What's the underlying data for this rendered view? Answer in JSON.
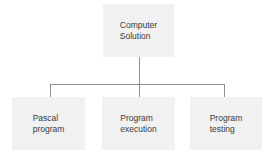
{
  "diagram": {
    "type": "hierarchy",
    "root": {
      "label": "Computer\nSolution"
    },
    "children": [
      {
        "label": "Pascal\nprogram"
      },
      {
        "label": "Program\nexecution"
      },
      {
        "label": "Program\ntesting"
      }
    ],
    "colors": {
      "box_fill": "#f1f1f1",
      "connector": "#8f8f8f",
      "text": "#3a3a3a"
    }
  }
}
